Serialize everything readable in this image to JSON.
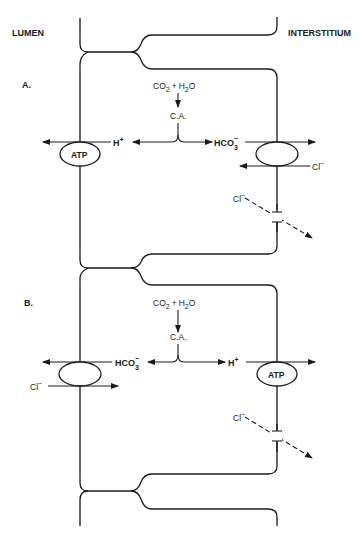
{
  "diagram": {
    "regions": {
      "left": "LUMEN",
      "right": "INTERSTITIUM"
    },
    "panels": [
      {
        "label": "A.",
        "reaction": {
          "reactant1": "CO",
          "reactant1_sub": "2",
          "plus": "+",
          "reactant2_a": "H",
          "reactant2_sub": "2",
          "reactant2_b": "O"
        },
        "enzyme": "C.A.",
        "left_ion": {
          "text": "H",
          "sup": "+"
        },
        "right_ion": {
          "text": "HCO",
          "sub": "3",
          "sup": "−"
        },
        "left_transporter": "ATP",
        "right_transporter": "",
        "exchange_ion": {
          "text": "Cl",
          "sup": "−"
        },
        "channel_ion": {
          "text": "Cl",
          "sup": "−"
        }
      },
      {
        "label": "B.",
        "reaction": {
          "reactant1": "CO",
          "reactant1_sub": "2",
          "plus": "+",
          "reactant2_a": "H",
          "reactant2_sub": "2",
          "reactant2_b": "O"
        },
        "enzyme": "C.A.",
        "left_ion": {
          "text": "HCO",
          "sub": "3",
          "sup": "−"
        },
        "right_ion": {
          "text": "H",
          "sup": "+"
        },
        "left_transporter": "",
        "right_transporter": "ATP",
        "exchange_ion": {
          "text": "Cl",
          "sup": "−"
        },
        "channel_ion": {
          "text": "Cl",
          "sup": "−"
        }
      }
    ],
    "colors": {
      "ink": "#1a1a1a",
      "background": "#ffffff"
    }
  }
}
